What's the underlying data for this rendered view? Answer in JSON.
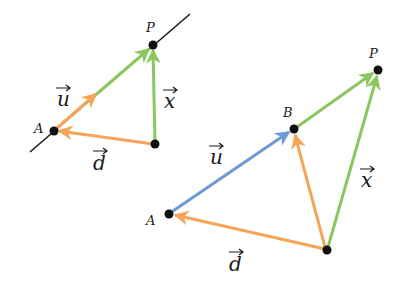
{
  "colors": {
    "orange": "#f5a55a",
    "green": "#8cc660",
    "blue": "#6e9bd4",
    "line": "#1a1a1a",
    "dot": "#111111"
  },
  "left_diagram": {
    "points": {
      "A": {
        "label": "A",
        "x": 54,
        "y": 131
      },
      "P": {
        "label": "P",
        "x": 153,
        "y": 45
      },
      "O": {
        "x": 155,
        "y": 144
      }
    },
    "labels": {
      "u": "u",
      "x": "x",
      "d": "d"
    }
  },
  "right_diagram": {
    "points": {
      "A": {
        "label": "A",
        "x": 169,
        "y": 214
      },
      "B": {
        "label": "B",
        "x": 294,
        "y": 129
      },
      "P": {
        "label": "P",
        "x": 378,
        "y": 70
      },
      "O": {
        "x": 327,
        "y": 250
      }
    },
    "labels": {
      "u": "u",
      "x": "x",
      "d": "d"
    }
  }
}
